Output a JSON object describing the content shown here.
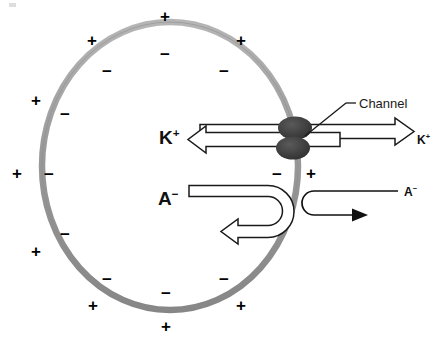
{
  "diagram": {
    "type": "cell-membrane-schematic",
    "colors": {
      "membrane": "#9a9a9a",
      "membrane_shade": "#7f7f7f",
      "channel": "#3a3a3a",
      "ink": "#000000",
      "background": "#ffffff"
    },
    "membrane": {
      "name": "cell-membrane",
      "shape": "ellipse",
      "center_x": 170,
      "center_y": 166,
      "radius_x": 128,
      "radius_y": 144,
      "stroke_width": 6
    },
    "channel": {
      "label": "Channel",
      "upper_blob": {
        "cx": 295,
        "cy": 128,
        "rx": 17,
        "ry": 11
      },
      "lower_blob": {
        "cx": 293,
        "cy": 148,
        "rx": 17,
        "ry": 11
      }
    },
    "ions": {
      "potassium_inside": "K",
      "potassium_inside_charge": "+",
      "potassium_outside": "K",
      "potassium_outside_charge": "+",
      "anion_inside": "A",
      "anion_inside_charge": "−",
      "anion_outside": "A",
      "anion_outside_charge": "−"
    },
    "charges_outside": [
      {
        "sign": "+",
        "x": 160,
        "y": 8
      },
      {
        "sign": "+",
        "x": 87,
        "y": 32
      },
      {
        "sign": "+",
        "x": 236,
        "y": 32
      },
      {
        "sign": "+",
        "x": 31,
        "y": 92
      },
      {
        "sign": "+",
        "x": 12,
        "y": 165
      },
      {
        "sign": "+",
        "x": 31,
        "y": 243
      },
      {
        "sign": "+",
        "x": 88,
        "y": 297
      },
      {
        "sign": "+",
        "x": 161,
        "y": 318
      },
      {
        "sign": "+",
        "x": 236,
        "y": 297
      },
      {
        "sign": "+",
        "x": 306,
        "y": 165
      }
    ],
    "charges_inside": [
      {
        "sign": "−",
        "x": 160,
        "y": 46
      },
      {
        "sign": "−",
        "x": 102,
        "y": 63
      },
      {
        "sign": "−",
        "x": 219,
        "y": 63
      },
      {
        "sign": "−",
        "x": 60,
        "y": 106
      },
      {
        "sign": "−",
        "x": 44,
        "y": 166
      },
      {
        "sign": "−",
        "x": 60,
        "y": 226
      },
      {
        "sign": "−",
        "x": 102,
        "y": 271
      },
      {
        "sign": "−",
        "x": 161,
        "y": 285
      },
      {
        "sign": "−",
        "x": 219,
        "y": 271
      },
      {
        "sign": "−",
        "x": 272,
        "y": 166
      }
    ],
    "arrows": {
      "k_outward": "hollow arrow from channel to outside pointing right",
      "k_inward": "hollow arrow from channel to inside pointing left",
      "a_inside_blocked": "hollow U-turn arrow inside cell, blocked by membrane",
      "a_outside_blocked": "thin solid U-turn arrow outside cell, blocked by membrane"
    }
  }
}
